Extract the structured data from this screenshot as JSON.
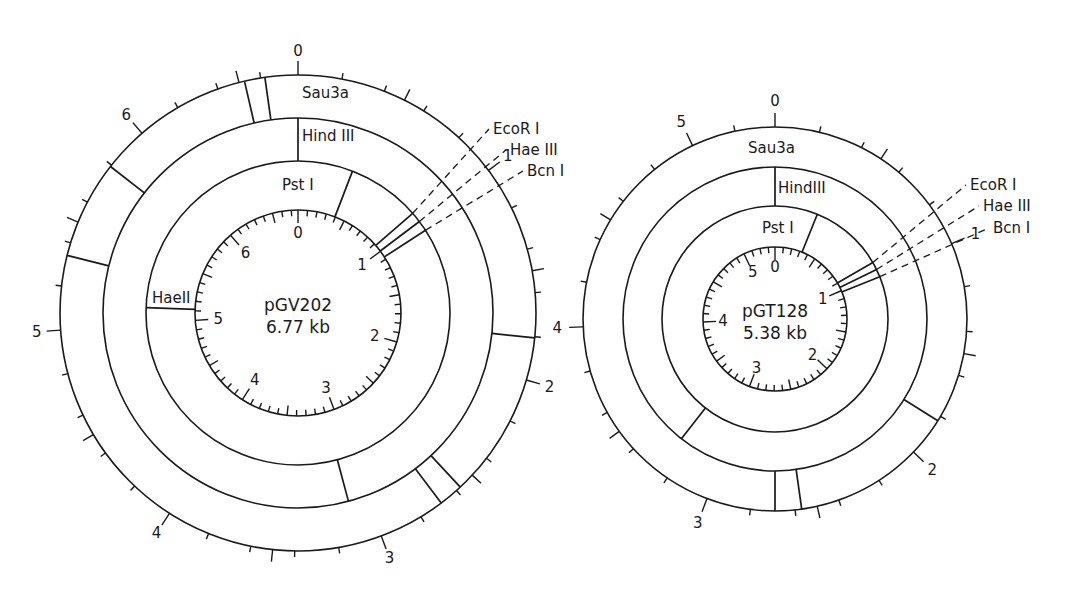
{
  "figure": {
    "background": "#ffffff",
    "ink": "#1a1a1a"
  },
  "plasmids": [
    {
      "name": "pGV202",
      "size_label": "6.77 kb",
      "size_kb": 6.77,
      "center": [
        298,
        313
      ],
      "radii": {
        "inner": 103,
        "pst": 152,
        "hind": 195,
        "outer": 238
      },
      "outer_scale": {
        "labels": [
          "0",
          "1",
          "2",
          "3",
          "4",
          "5",
          "6"
        ],
        "label_radius": 262
      },
      "inner_scale": {
        "labels": [
          "0",
          "1",
          "2",
          "3",
          "4",
          "5",
          "6"
        ],
        "label_radius": 80
      },
      "rings": [
        {
          "name": "Sau3a",
          "label": "Sau3a",
          "label_pos": [
            302,
            98
          ],
          "inner_r": "hind",
          "outer_r": "outer",
          "cuts_deg": [
            -13,
            -8,
            -52,
            -76,
            96,
            137,
            143
          ]
        },
        {
          "name": "HindIII",
          "label": "Hind III",
          "label_pos": [
            302,
            141
          ],
          "inner_r": "pst",
          "outer_r": "hind",
          "cuts_deg": [
            0,
            165
          ]
        },
        {
          "name": "PstI",
          "label": "Pst I",
          "label_pos": [
            282,
            190
          ],
          "inner_r": "inner",
          "outer_r": "pst",
          "cuts_deg": [
            21
          ]
        }
      ],
      "extra_cuts": [
        {
          "name": "HaeII",
          "label": "HaeII",
          "deg": -88,
          "from_r": "inner",
          "to_r": "pst",
          "label_pos": [
            152,
            303
          ]
        }
      ],
      "dashed_sites": [
        {
          "name": "EcoRI",
          "label": "EcoR I",
          "deg": 49,
          "label_pos": [
            493,
            134
          ]
        },
        {
          "name": "HaeIII",
          "label": "Hae III",
          "deg": 53,
          "label_pos": [
            510,
            155
          ]
        },
        {
          "name": "BcnI",
          "label": "Bcn I",
          "deg": 57,
          "label_pos": [
            527,
            176
          ]
        }
      ]
    },
    {
      "name": "pGT128",
      "size_label": "5.38 kb",
      "size_kb": 5.38,
      "center": [
        775,
        319
      ],
      "radii": {
        "inner": 72,
        "pst": 113,
        "hind": 152,
        "outer": 192
      },
      "outer_scale": {
        "labels": [
          "0",
          "1",
          "2",
          "3",
          "4",
          "5"
        ],
        "label_radius": 218
      },
      "inner_scale": {
        "labels": [
          "0",
          "1",
          "2",
          "3",
          "4",
          "5"
        ],
        "label_radius": 52
      },
      "rings": [
        {
          "name": "Sau3a",
          "label": "Sau3a",
          "label_pos": [
            748,
            153
          ],
          "inner_r": "hind",
          "outer_r": "outer",
          "cuts_deg": [
            122,
            172,
            180
          ]
        },
        {
          "name": "HindIII",
          "label": "HindIII",
          "label_pos": [
            778,
            193
          ],
          "inner_r": "pst",
          "outer_r": "hind",
          "cuts_deg": [
            0,
            218
          ]
        },
        {
          "name": "PstI",
          "label": "Pst I",
          "label_pos": [
            762,
            233
          ],
          "inner_r": "inner",
          "outer_r": "pst",
          "cuts_deg": [
            22
          ]
        }
      ],
      "extra_cuts": [],
      "dashed_sites": [
        {
          "name": "EcoRI",
          "label": "EcoR I",
          "deg": 60,
          "label_pos": [
            970,
            190
          ]
        },
        {
          "name": "HaeIII",
          "label": "Hae III",
          "deg": 64,
          "label_pos": [
            983,
            211
          ]
        },
        {
          "name": "BcnI",
          "label": "Bcn I",
          "deg": 68,
          "label_pos": [
            993,
            233
          ]
        }
      ]
    }
  ]
}
